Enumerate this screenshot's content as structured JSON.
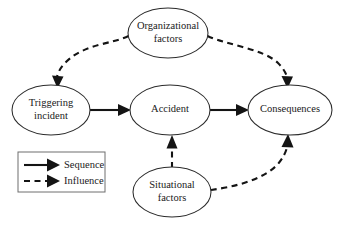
{
  "figure": {
    "type": "flow-diagram",
    "background_color": "#ffffff",
    "line_color": "#141414",
    "node_stroke_color": "#2b2b2b",
    "text_color": "#1a1a1a"
  },
  "nodes": [
    {
      "id": "organizational-factors",
      "label_line1": "Organizational",
      "label_line2": "factors",
      "cx": 168,
      "cy": 33,
      "rx": 40,
      "ry": 25
    },
    {
      "id": "triggering-incident",
      "label_line1": "Triggering",
      "label_line2": "incident",
      "cx": 51,
      "cy": 110,
      "rx": 39,
      "ry": 25
    },
    {
      "id": "accident",
      "label_line1": "Accident",
      "label_line2": "",
      "cx": 170,
      "cy": 110,
      "rx": 40,
      "ry": 25
    },
    {
      "id": "consequences",
      "label_line1": "Consequences",
      "label_line2": "",
      "cx": 290,
      "cy": 110,
      "rx": 42,
      "ry": 25
    },
    {
      "id": "situational-factors",
      "label_line1": "Situational",
      "label_line2": "factors",
      "cx": 172,
      "cy": 192,
      "rx": 39,
      "ry": 25
    }
  ],
  "edges": [
    {
      "id": "triggering-to-accident",
      "kind": "sequence",
      "style": "solid",
      "from": "triggering-incident",
      "to": "accident"
    },
    {
      "id": "accident-to-consequences",
      "kind": "sequence",
      "style": "solid",
      "from": "accident",
      "to": "consequences"
    },
    {
      "id": "organizational-to-triggering",
      "kind": "influence",
      "style": "dashed",
      "from": "organizational-factors",
      "to": "triggering-incident"
    },
    {
      "id": "organizational-to-consequences",
      "kind": "influence",
      "style": "dashed",
      "from": "organizational-factors",
      "to": "consequences"
    },
    {
      "id": "situational-to-accident",
      "kind": "influence",
      "style": "dashed",
      "from": "situational-factors",
      "to": "accident"
    },
    {
      "id": "situational-to-consequences",
      "kind": "influence",
      "style": "dashed",
      "from": "situational-factors",
      "to": "consequences"
    }
  ],
  "legend": {
    "box": {
      "x": 18,
      "y": 152,
      "width": 87,
      "height": 40
    },
    "items": [
      {
        "id": "sequence",
        "label": "Sequence",
        "style": "solid"
      },
      {
        "id": "influence",
        "label": "Influence",
        "style": "dashed"
      }
    ]
  }
}
